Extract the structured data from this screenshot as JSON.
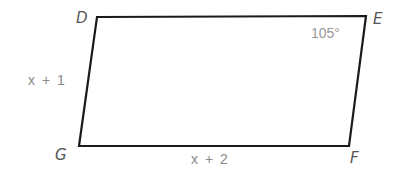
{
  "figure": {
    "shape": "parallelogram",
    "vertices": {
      "D": "D",
      "E": "E",
      "F": "F",
      "G": "G"
    },
    "angle_E": "105°",
    "side_DG": "x + 1",
    "side_GF": "x + 2",
    "stroke_color": "#1a1a1a",
    "label_color": "#555555",
    "measure_color": "#8a8a8a"
  }
}
